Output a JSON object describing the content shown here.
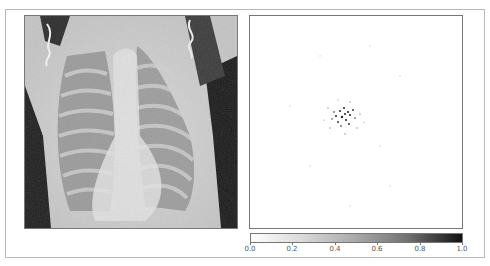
{
  "figure": {
    "left_panel": {
      "kind": "chest-xray-image"
    },
    "right_panel": {
      "kind": "saliency-heatmap",
      "hotspot_center": [
        0.45,
        0.48
      ]
    },
    "colorbar": {
      "min": 0.0,
      "max": 1.0,
      "colormap": "white-to-black",
      "ticks": [
        "0.0",
        "0.2",
        "0.4",
        "0.6",
        "0.8",
        "1.0"
      ]
    }
  }
}
